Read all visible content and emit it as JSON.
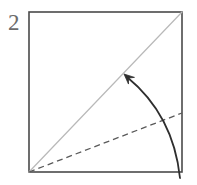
{
  "figure": {
    "kind": "origami-fold-step-diagram",
    "step_label": "2",
    "background_color": "#ffffff",
    "canvas": {
      "width": 197,
      "height": 185
    }
  },
  "labels": {
    "step_number": "2"
  },
  "chart_data": {
    "type": "diagram",
    "title": "",
    "elements": [
      {
        "name": "step-number",
        "kind": "text",
        "text": "2",
        "x": 8,
        "y": 30,
        "color": "#6b6b6b",
        "font_size": 23
      },
      {
        "name": "paper-square",
        "kind": "rect",
        "x": 29,
        "y": 12,
        "width": 153,
        "height": 160,
        "stroke": "#4a4a4a",
        "stroke_width": 1.6,
        "fill": "none"
      },
      {
        "name": "diagonal-crease",
        "kind": "line",
        "x1": 29,
        "y1": 172,
        "x2": 182,
        "y2": 12,
        "stroke": "#b9b9b9",
        "stroke_width": 1.2,
        "dash": "none"
      },
      {
        "name": "dashed-fold-line",
        "kind": "line",
        "x1": 29,
        "y1": 172,
        "x2": 182,
        "y2": 113,
        "stroke": "#5a5a5a",
        "stroke_width": 1.3,
        "dash": "6 4"
      },
      {
        "name": "fold-arrow",
        "kind": "curved-arrow",
        "path": "M 180 178 C 176 140 160 104 127 77",
        "stroke": "#2e2e2e",
        "stroke_width": 1.8,
        "arrowhead_at": {
          "x": 124,
          "y": 74
        },
        "arrowhead_size": 11,
        "direction": "up-left"
      }
    ],
    "axis": {
      "shown": false
    },
    "grid": false,
    "legend": {
      "shown": false
    }
  }
}
